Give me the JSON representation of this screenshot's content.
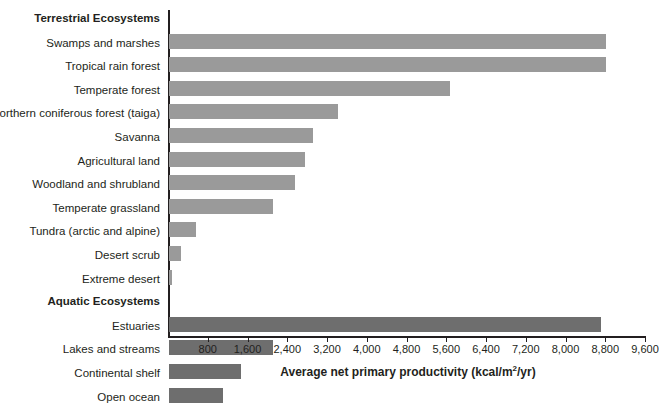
{
  "chart_data": {
    "type": "bar",
    "orientation": "horizontal",
    "title": "",
    "xlabel": "Average net primary productivity (kcal/m2/yr)",
    "xlabel_parts": {
      "pre": "Average net primary productivity (kcal/m",
      "sup": "2",
      "post": "/yr)"
    },
    "ylabel": "",
    "xlim": [
      0,
      9600
    ],
    "xticks": [
      800,
      1600,
      2400,
      3200,
      4000,
      4800,
      5600,
      6400,
      7200,
      8000,
      8800,
      9600
    ],
    "xtick_labels": [
      "800",
      "1,600",
      "2,400",
      "3,200",
      "4,000",
      "4,800",
      "5,600",
      "6,400",
      "7,200",
      "8,000",
      "8,800",
      "9,600"
    ],
    "grid": false,
    "legend": "none",
    "groups": [
      {
        "name": "Terrestrial Ecosystems",
        "color": "#9a9a9a",
        "categories": [
          "Swamps and marshes",
          "Tropical rain forest",
          "Temperate forest",
          "Northern coniferous forest (taiga)",
          "Savanna",
          "Agricultural land",
          "Woodland and shrubland",
          "Temperate grassland",
          "Tundra (arctic and alpine)",
          "Desert scrub",
          "Extreme desert"
        ],
        "values": [
          8800,
          8800,
          5650,
          3400,
          2900,
          2730,
          2530,
          2090,
          540,
          250,
          60
        ]
      },
      {
        "name": "Aquatic Ecosystems",
        "color": "#6e6e6e",
        "categories": [
          "Estuaries",
          "Lakes and streams",
          "Continental shelf",
          "Open ocean"
        ],
        "values": [
          8700,
          2090,
          1450,
          1080
        ]
      }
    ],
    "rows": [
      {
        "kind": "group",
        "label": "Terrestrial Ecosystems"
      },
      {
        "kind": "bar",
        "label": "Swamps and marshes",
        "value": 8800,
        "series": "terrestrial"
      },
      {
        "kind": "bar",
        "label": "Tropical rain forest",
        "value": 8800,
        "series": "terrestrial"
      },
      {
        "kind": "bar",
        "label": "Temperate forest",
        "value": 5650,
        "series": "terrestrial"
      },
      {
        "kind": "bar",
        "label": "Northern coniferous forest (taiga)",
        "value": 3400,
        "series": "terrestrial"
      },
      {
        "kind": "bar",
        "label": "Savanna",
        "value": 2900,
        "series": "terrestrial"
      },
      {
        "kind": "bar",
        "label": "Agricultural land",
        "value": 2730,
        "series": "terrestrial"
      },
      {
        "kind": "bar",
        "label": "Woodland and shrubland",
        "value": 2530,
        "series": "terrestrial"
      },
      {
        "kind": "bar",
        "label": "Temperate grassland",
        "value": 2090,
        "series": "terrestrial"
      },
      {
        "kind": "bar",
        "label": "Tundra (arctic and alpine)",
        "value": 540,
        "series": "terrestrial"
      },
      {
        "kind": "bar",
        "label": "Desert scrub",
        "value": 250,
        "series": "terrestrial"
      },
      {
        "kind": "bar",
        "label": "Extreme desert",
        "value": 60,
        "series": "terrestrial"
      },
      {
        "kind": "group",
        "label": "Aquatic Ecosystems"
      },
      {
        "kind": "bar",
        "label": "Estuaries",
        "value": 8700,
        "series": "aquatic"
      },
      {
        "kind": "bar",
        "label": "Lakes and streams",
        "value": 2090,
        "series": "aquatic"
      },
      {
        "kind": "bar",
        "label": "Continental shelf",
        "value": 1450,
        "series": "aquatic"
      },
      {
        "kind": "bar",
        "label": "Open ocean",
        "value": 1080,
        "series": "aquatic"
      }
    ],
    "colors": {
      "terrestrial_bar": "#9a9a9a",
      "aquatic_bar": "#6e6e6e",
      "axis": "#231f20",
      "text": "#231f20",
      "background": "#ffffff"
    }
  }
}
